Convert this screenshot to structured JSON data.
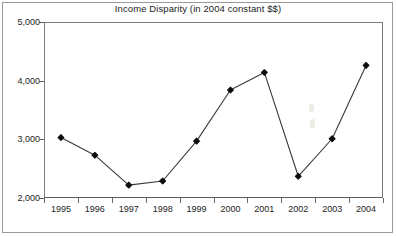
{
  "chart_data": {
    "type": "line",
    "title": "Income Disparity (in 2004 constant $$)",
    "xlabel": "",
    "ylabel": "",
    "categories": [
      "1995",
      "1996",
      "1997",
      "1998",
      "1999",
      "2000",
      "2001",
      "2002",
      "2003",
      "2004"
    ],
    "values": [
      3030,
      2730,
      2220,
      2290,
      2970,
      3840,
      4140,
      2370,
      3010,
      4260
    ],
    "series": [
      {
        "name": "Income Disparity",
        "values": [
          3030,
          2730,
          2220,
          2290,
          2970,
          3840,
          4140,
          2370,
          3010,
          4260
        ]
      }
    ],
    "ylim": [
      2000,
      5000
    ],
    "yticks": [
      2000,
      3000,
      4000,
      5000
    ],
    "ytick_labels": [
      "2,000",
      "3,000",
      "4,000",
      "5,000"
    ],
    "grid": false,
    "legend": false,
    "marker": "filled-diamond",
    "line_color": "#3a3a3a",
    "marker_color": "#0d0d0d",
    "axis_color": "#6d6d6d",
    "background": "#ffffff"
  },
  "figure": {
    "title": "Income Disparity (in 2004 constant $$)"
  }
}
